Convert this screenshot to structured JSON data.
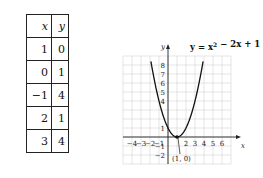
{
  "table": {
    "headers": [
      "x",
      "y"
    ],
    "rows": [
      {
        "x": "1",
        "y": "0"
      },
      {
        "x": "0",
        "y": "1"
      },
      {
        "x": "−1",
        "y": "4"
      },
      {
        "x": "2",
        "y": "1"
      },
      {
        "x": "3",
        "y": "4"
      }
    ]
  },
  "chart_data": {
    "type": "line",
    "equation": "y = x^2 - 2x + 1",
    "xlabel": "x",
    "ylabel": "y",
    "xlim": [
      -5,
      7
    ],
    "ylim": [
      -3,
      9
    ],
    "grid": true,
    "x_tick_labels": [
      "−4",
      "−3",
      "−2",
      "−1",
      "2",
      "3",
      "4",
      "5",
      "6"
    ],
    "x_ticks": [
      -4,
      -3,
      -2,
      -1,
      2,
      3,
      4,
      5,
      6
    ],
    "y_tick_labels": [
      "8",
      "7",
      "6",
      "5",
      "4",
      "1",
      "−1",
      "−2"
    ],
    "y_ticks": [
      8,
      7,
      6,
      5,
      4,
      1,
      -1,
      -2
    ],
    "series": [
      {
        "name": "y = x^2 - 2x + 1",
        "x_range": [
          -1.9,
          3.9
        ],
        "coefficients": [
          1,
          -2,
          1
        ]
      }
    ],
    "annotations": [
      {
        "text": "(1, 0)",
        "x": 1,
        "y": 0
      }
    ],
    "vertex": {
      "x": 1,
      "y": 0
    }
  }
}
